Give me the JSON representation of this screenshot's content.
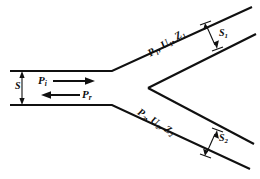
{
  "figure": {
    "type": "pipe-bifurcation-diagram",
    "background_color": "#ffffff",
    "line_color": "#101010"
  },
  "labels": {
    "inlet_area": "S",
    "incident_wave": "P",
    "incident_wave_sub": "i",
    "reflected_wave": "P",
    "reflected_wave_sub": "r",
    "branch1": "P₁, U₁, Z₁",
    "branch2": "P₂, U₂, Z₂",
    "branch1_area": "S",
    "branch1_area_sub": "1",
    "branch2_area": "S",
    "branch2_area_sub": "2"
  },
  "geometry": {
    "main_duct": {
      "top_wall_y": 71,
      "bottom_wall_y": 105,
      "left_x": 10,
      "junction_x": 112
    },
    "branch_upper": {
      "angle_deg": -32,
      "label_position": "above-wall"
    },
    "branch_lower": {
      "angle_deg": 32,
      "label_position": "below-wall"
    },
    "vertex": {
      "x": 148,
      "y": 88
    }
  },
  "arrows": {
    "incident_direction": "right",
    "reflected_direction": "left",
    "dimension_style": "double-headed"
  }
}
